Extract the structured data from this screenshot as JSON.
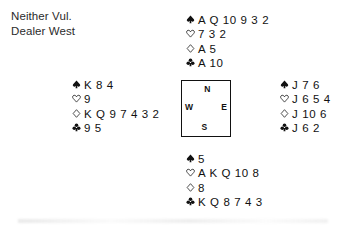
{
  "deal_info": {
    "vulnerability": "Neither Vul.",
    "dealer": "Dealer West"
  },
  "suits": {
    "spade_symbol": "spade-icon",
    "heart_symbol": "heart-icon",
    "diamond_symbol": "diamond-icon",
    "club_symbol": "club-icon"
  },
  "compass": {
    "north": "N",
    "west": "W",
    "east": "E",
    "south": "S"
  },
  "hands": {
    "north": {
      "label": "North",
      "spades": "A Q 10 9 3 2",
      "hearts": "7 3 2",
      "diamonds": "A 5",
      "clubs": "A 10"
    },
    "west": {
      "label": "West",
      "spades": "K 8 4",
      "hearts": "9",
      "diamonds": "K Q 9 7 4 3 2",
      "clubs": "9 5"
    },
    "east": {
      "label": "East",
      "spades": "J 7 6",
      "hearts": "J 6 5 4",
      "diamonds": "J 10 6",
      "clubs": "J 6 2"
    },
    "south": {
      "label": "South",
      "spades": "5",
      "hearts": "A K Q 10 8",
      "diamonds": "8",
      "clubs": "K Q 8 7 4 3"
    }
  },
  "colors": {
    "ink": "#111111",
    "paper": "#ffffff"
  }
}
